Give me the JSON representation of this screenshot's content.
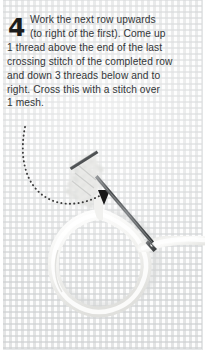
{
  "page": {
    "background_color": "#fdfdfd",
    "fabric_grid_color": "#ced0d1"
  },
  "instruction": {
    "step_number": "4",
    "lines": [
      "Work the next row upwards",
      "(to right of the first). Come up",
      "1 thread above the end of the last",
      "crossing stitch of the completed row",
      "and down 3 threads below and to",
      "right. Cross this with a stitch over",
      "1 mesh."
    ],
    "text_color": "#333638",
    "number_color": "#1c1c1c"
  },
  "illustration": {
    "caption": "needle passing through canvas mesh with white yarn loop",
    "elements": [
      {
        "name": "guide-arrow",
        "label": "dotted curved direction arrow",
        "color": "#3b3b3b"
      },
      {
        "name": "needle",
        "label": "tapestry needle",
        "color": "#6c6f72"
      },
      {
        "name": "yarn-loop",
        "label": "white wool yarn loop",
        "color": "#f2f2f0"
      },
      {
        "name": "worked-stitches",
        "label": "completed cross stitches",
        "color": "#e4e4e2"
      }
    ]
  }
}
